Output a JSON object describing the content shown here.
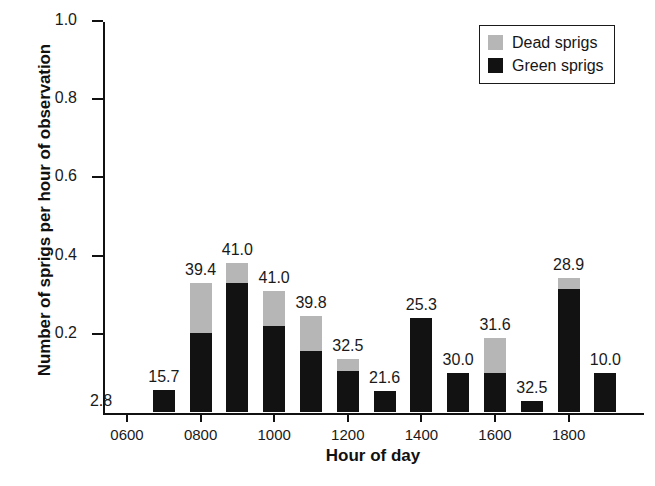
{
  "chart_data": {
    "type": "bar",
    "title": "",
    "subtitle": "",
    "xlabel": "Hour of day",
    "ylabel": "Number of sprigs per hour of observation",
    "ylim": [
      0,
      1.0
    ],
    "yticks": [
      "0.2",
      "0.4",
      "0.6",
      "0.8",
      "1.0"
    ],
    "ytick_values": [
      0.2,
      0.4,
      0.6,
      0.8,
      1.0
    ],
    "xticks": [
      "0600",
      "0800",
      "1000",
      "1200",
      "1400",
      "1600",
      "1800"
    ],
    "grid": false,
    "stacked": true,
    "legend_position": "top-right",
    "legend": [
      "Dead sprigs",
      "Green sprigs"
    ],
    "categories": [
      "0600",
      "0700",
      "0800",
      "0900",
      "1000",
      "1100",
      "1200",
      "1300",
      "1400",
      "1500",
      "1600",
      "1700",
      "1800",
      "1900"
    ],
    "series": [
      {
        "name": "Green sprigs",
        "color": "#121212",
        "values": [
          0.0,
          0.056,
          0.203,
          0.331,
          0.219,
          0.157,
          0.104,
          0.053,
          0.24,
          0.099,
          0.101,
          0.027,
          0.315,
          0.099
        ]
      },
      {
        "name": "Dead sprigs",
        "color": "#b6b6b6",
        "values": [
          0.0,
          0.0,
          0.128,
          0.05,
          0.09,
          0.088,
          0.032,
          0.0,
          0.0,
          0.0,
          0.088,
          0.0,
          0.029,
          0.0
        ]
      }
    ],
    "totals": [
      0.0,
      0.056,
      0.331,
      0.381,
      0.309,
      0.245,
      0.136,
      0.053,
      0.24,
      0.099,
      0.189,
      0.027,
      0.344,
      0.099
    ],
    "bar_labels": [
      "2.8",
      "15.7",
      "39.4",
      "41.0",
      "41.0",
      "39.8",
      "32.5",
      "21.6",
      "25.3",
      "30.0",
      "31.6",
      "32.5",
      "28.9",
      "10.0"
    ],
    "bar_label_note": "Annotation above each bar (percentage of observation hours)",
    "colors": {
      "dead_sprigs": "#b6b6b6",
      "green_sprigs": "#121212",
      "axis": "#111111",
      "background": "#ffffff"
    }
  }
}
